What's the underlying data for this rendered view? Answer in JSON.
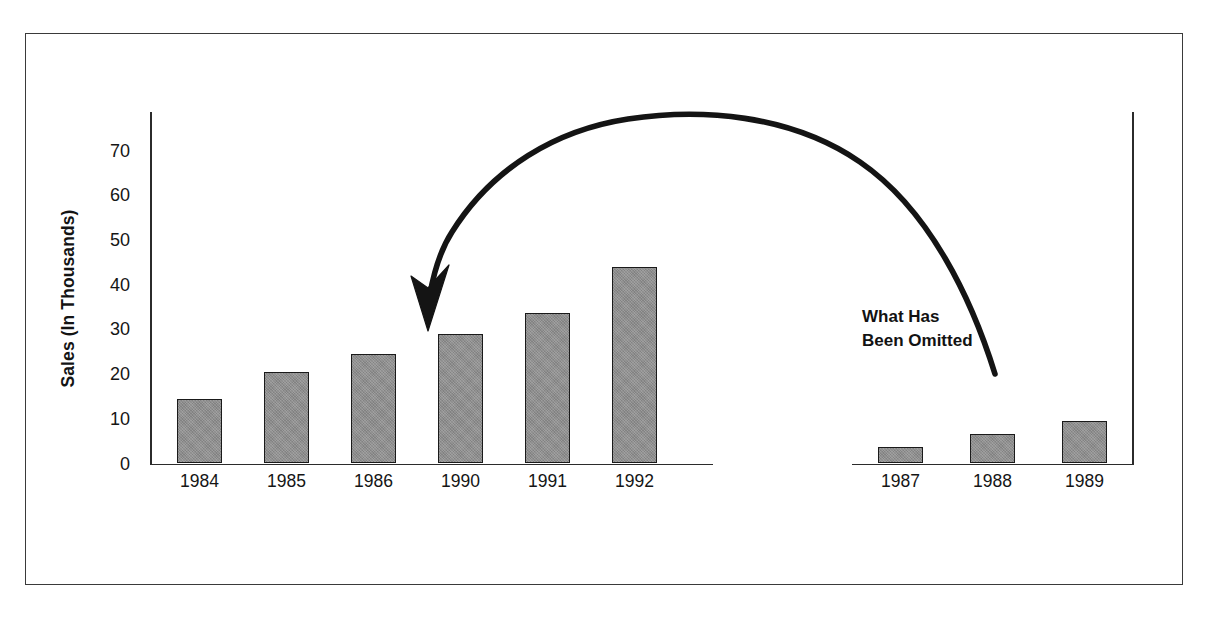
{
  "chart_data": {
    "type": "bar",
    "title": "",
    "subtitle": "",
    "xlabel": "",
    "ylabel": "Sales (In Thousands)",
    "ylim": [
      0,
      75
    ],
    "yticks": [
      70,
      60,
      50,
      40,
      30,
      20,
      10,
      0
    ],
    "grid": false,
    "legend": null,
    "panels": [
      {
        "name": "main-series",
        "categories": [
          "1984",
          "1985",
          "1986",
          "1990",
          "1991",
          "1992"
        ],
        "values": [
          14.5,
          20.4,
          24.5,
          29,
          33.7,
          44
        ]
      },
      {
        "name": "omitted-series",
        "categories": [
          "1987",
          "1988",
          "1989"
        ],
        "values": [
          3.6,
          6.5,
          9.5
        ]
      }
    ],
    "annotations": [
      {
        "name": "omitted-callout",
        "line1": "What Has",
        "line2": "Been Omitted",
        "arrow": "curved-arrow-pointing-left"
      }
    ],
    "colors": {
      "bar_fill": "#8c8c8c",
      "bar_stroke": "#1a1a1a",
      "axis": "#2b2b2b",
      "text": "#151515",
      "frame": "#3a3a3a",
      "background": "#ffffff"
    }
  },
  "axis": {
    "y_title": "Sales (In Thousands)",
    "ticks": [
      {
        "label": "70",
        "value": 70
      },
      {
        "label": "60",
        "value": 60
      },
      {
        "label": "50",
        "value": 50
      },
      {
        "label": "40",
        "value": 40
      },
      {
        "label": "30",
        "value": 30
      },
      {
        "label": "20",
        "value": 20
      },
      {
        "label": "10",
        "value": 10
      },
      {
        "label": "0",
        "value": 0
      }
    ]
  },
  "main_chart": {
    "bars": [
      {
        "label": "1984",
        "value": 14.5
      },
      {
        "label": "1985",
        "value": 20.4
      },
      {
        "label": "1986",
        "value": 24.5
      },
      {
        "label": "1990",
        "value": 29
      },
      {
        "label": "1991",
        "value": 33.7
      },
      {
        "label": "1992",
        "value": 44
      }
    ]
  },
  "inset_chart": {
    "bars": [
      {
        "label": "1987",
        "value": 3.6
      },
      {
        "label": "1988",
        "value": 6.5
      },
      {
        "label": "1989",
        "value": 9.5
      }
    ]
  },
  "callout": {
    "line1": "What Has",
    "line2": "Been Omitted"
  }
}
